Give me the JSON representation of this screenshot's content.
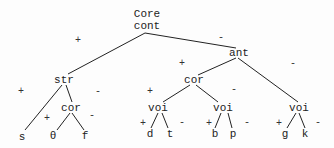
{
  "diagram": {
    "type": "feature-tree",
    "root": {
      "line1": "Core",
      "line2": "cont"
    },
    "nodes": {
      "str": "str",
      "ant": "ant",
      "cor_left": "cor",
      "cor_mid": "cor",
      "voi_1": "voi",
      "voi_2": "voi",
      "voi_3": "voi"
    },
    "leaves": [
      "s",
      "θ",
      "f",
      "d",
      "t",
      "b",
      "p",
      "g",
      "k"
    ],
    "signs": {
      "root_plus": "+",
      "root_minus": "-",
      "ant_plus": "+",
      "ant_minus": "-",
      "str_plus": "+",
      "str_minus": "-",
      "cor_left_plus": "+",
      "cor_left_minus": "-",
      "cor_mid_plus": "+",
      "cor_mid_minus": "-",
      "voi_1_plus": "+",
      "voi_1_minus": "-",
      "voi_2_plus": "+",
      "voi_2_minus": "-",
      "voi_3_plus": "+",
      "voi_3_minus": "-"
    },
    "line_color": "#222222"
  }
}
